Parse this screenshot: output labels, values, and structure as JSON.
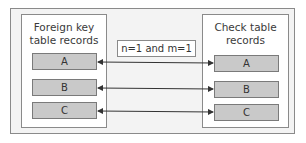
{
  "diagram": {
    "left_table": {
      "title_line1": "Foreign key",
      "title_line2": "table records",
      "records": [
        "A",
        "B",
        "C"
      ]
    },
    "right_table": {
      "title_line1": "Check table",
      "title_line2": "records",
      "records": [
        "A",
        "B",
        "C"
      ]
    },
    "cardinality_label": "n=1 and m=1",
    "connections": [
      {
        "from": "A",
        "to": "A",
        "type": "bidirectional"
      },
      {
        "from": "B",
        "to": "B",
        "type": "bidirectional"
      },
      {
        "from": "C",
        "to": "C",
        "type": "bidirectional"
      }
    ],
    "colors": {
      "frame_bg": "#f3f3f3",
      "box_bg": "#ffffff",
      "record_fill": "#c9c9c9",
      "border": "#8a8a8a",
      "arrow": "#333333"
    }
  }
}
